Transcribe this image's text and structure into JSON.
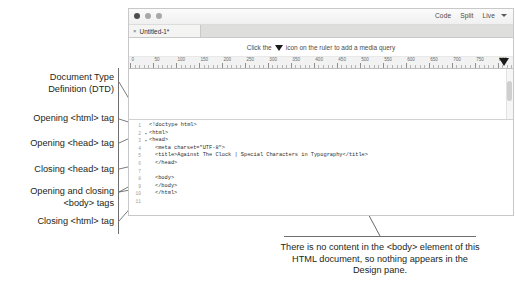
{
  "window": {
    "titlebar": {
      "traffic_lights": [
        "close",
        "minimize",
        "zoom"
      ],
      "view_modes": [
        {
          "label": "Code"
        },
        {
          "label": "Split"
        },
        {
          "label": "Live"
        }
      ],
      "caret_icon": "chevron-down-icon"
    },
    "tab": {
      "close_glyph": "×",
      "title": "Untitled-1*"
    },
    "media_query_hint": {
      "text_before": "Click the",
      "icon": "media-query-triangle-icon",
      "text_after": "icon on the ruler to add a media query"
    },
    "ruler": {
      "labels": [
        "0",
        "50",
        "100",
        "150",
        "200",
        "250",
        "300",
        "350",
        "400",
        "450",
        "500",
        "550",
        "600",
        "650",
        "700",
        "750",
        "800"
      ],
      "marker_icon": "media-query-marker-icon"
    },
    "design_pane": {
      "content": "",
      "scrollbar": "vertical-scrollbar"
    },
    "code_pane": {
      "lines": [
        {
          "num": "1",
          "fold": "",
          "indent": 0,
          "text": "<!doctype html>"
        },
        {
          "num": "2",
          "fold": "▾",
          "indent": 0,
          "text": "<html>"
        },
        {
          "num": "3",
          "fold": "▾",
          "indent": 0,
          "text": "<head>"
        },
        {
          "num": "4",
          "fold": "",
          "indent": 1,
          "text": "<meta charset=\"UTF-8\">"
        },
        {
          "num": "5",
          "fold": "",
          "indent": 1,
          "text": "<title>Against The Clock | Special Characters in Typography</title>"
        },
        {
          "num": "6",
          "fold": "",
          "indent": 1,
          "text": "</head>"
        },
        {
          "num": "7",
          "fold": "",
          "indent": 0,
          "text": ""
        },
        {
          "num": "8",
          "fold": "",
          "indent": 1,
          "text": "<body>"
        },
        {
          "num": "9",
          "fold": "",
          "indent": 1,
          "text": "</body>"
        },
        {
          "num": "10",
          "fold": "",
          "indent": 1,
          "text": "</html>"
        },
        {
          "num": "11",
          "fold": "",
          "indent": 0,
          "text": ""
        }
      ]
    }
  },
  "annotations": {
    "dtd": "Document Type\nDefinition (DTD)",
    "html_open": "Opening <html> tag",
    "head_open": "Opening <head> tag",
    "head_close": "Closing <head> tag",
    "body_tags": "Opening and closing\n<body> tags",
    "html_close": "Closing <html> tag"
  },
  "caption": {
    "text": "There is no content in the <body> element of this HTML document, so nothing appears in the Design pane."
  },
  "colors": {
    "text": "#231f20",
    "leader": "#6d6e71",
    "window_border": "#c8c8c8",
    "tabbar": "#dededd"
  }
}
